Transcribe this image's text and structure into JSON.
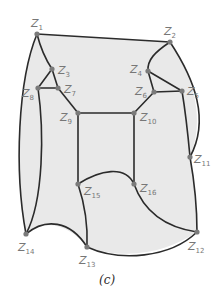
{
  "figure": {
    "caption": "(c)",
    "colors": {
      "region_fill": "#e9e9e9",
      "edge": "#2b2b2b",
      "node": "#7a7a7a",
      "label": "#777777"
    }
  },
  "nodes": [
    {
      "id": "Z1",
      "base": "Z",
      "sub": "1",
      "x": 37,
      "y": 34
    },
    {
      "id": "Z2",
      "base": "Z",
      "sub": "2",
      "x": 170,
      "y": 42
    },
    {
      "id": "Z3",
      "base": "Z",
      "sub": "3",
      "x": 52,
      "y": 69
    },
    {
      "id": "Z4",
      "base": "Z",
      "sub": "4",
      "x": 148,
      "y": 71
    },
    {
      "id": "Z5",
      "base": "Z",
      "sub": "5",
      "x": 182,
      "y": 91
    },
    {
      "id": "Z6",
      "base": "Z",
      "sub": "6",
      "x": 154,
      "y": 92
    },
    {
      "id": "Z7",
      "base": "Z",
      "sub": "7",
      "x": 58,
      "y": 88
    },
    {
      "id": "Z8",
      "base": "Z",
      "sub": "8",
      "x": 38,
      "y": 88
    },
    {
      "id": "Z9",
      "base": "Z",
      "sub": "9",
      "x": 78,
      "y": 113
    },
    {
      "id": "Z10",
      "base": "Z",
      "sub": "10",
      "x": 134,
      "y": 113
    },
    {
      "id": "Z11",
      "base": "Z",
      "sub": "11",
      "x": 190,
      "y": 157
    },
    {
      "id": "Z12",
      "base": "Z",
      "sub": "12",
      "x": 197,
      "y": 232
    },
    {
      "id": "Z13",
      "base": "Z",
      "sub": "13",
      "x": 87,
      "y": 247
    },
    {
      "id": "Z14",
      "base": "Z",
      "sub": "14",
      "x": 26,
      "y": 234
    },
    {
      "id": "Z15",
      "base": "Z",
      "sub": "15",
      "x": 78,
      "y": 184
    },
    {
      "id": "Z16",
      "base": "Z",
      "sub": "16",
      "x": 134,
      "y": 184
    }
  ],
  "edges": [
    [
      "Z1",
      "Z2"
    ],
    [
      "Z1",
      "Z3"
    ],
    [
      "Z1",
      "Z14"
    ],
    [
      "Z2",
      "Z4"
    ],
    [
      "Z2",
      "Z11"
    ],
    [
      "Z3",
      "Z7"
    ],
    [
      "Z3",
      "Z8"
    ],
    [
      "Z7",
      "Z8"
    ],
    [
      "Z7",
      "Z9"
    ],
    [
      "Z8",
      "Z14"
    ],
    [
      "Z4",
      "Z5"
    ],
    [
      "Z4",
      "Z6"
    ],
    [
      "Z6",
      "Z5"
    ],
    [
      "Z6",
      "Z10"
    ],
    [
      "Z5",
      "Z11"
    ],
    [
      "Z9",
      "Z10"
    ],
    [
      "Z9",
      "Z15"
    ],
    [
      "Z10",
      "Z16"
    ],
    [
      "Z15",
      "Z12"
    ],
    [
      "Z16",
      "Z12"
    ],
    [
      "Z15",
      "Z13"
    ],
    [
      "Z11",
      "Z12"
    ],
    [
      "Z14",
      "Z13"
    ],
    [
      "Z13",
      "Z12"
    ]
  ]
}
